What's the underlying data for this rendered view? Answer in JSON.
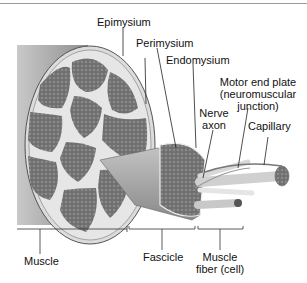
{
  "diagram": {
    "labels": {
      "epimysium": "Epimysium",
      "perimysium": "Perimysium",
      "endomysium": "Endomysium",
      "motor_end_plate_1": "Motor end plate",
      "motor_end_plate_2": "(neuromuscular",
      "motor_end_plate_3": "junction)",
      "nerve_axon_1": "Nerve",
      "nerve_axon_2": "axon",
      "capillary": "Capillary",
      "muscle": "Muscle",
      "fascicle": "Fascicle",
      "muscle_fiber_1": "Muscle",
      "muscle_fiber_2": "fiber (cell)"
    },
    "colors": {
      "tissue": "#7a7a7a",
      "connective": "#e6e6e6",
      "outer_shadow": "#9c9c9c",
      "line": "#222222"
    }
  }
}
